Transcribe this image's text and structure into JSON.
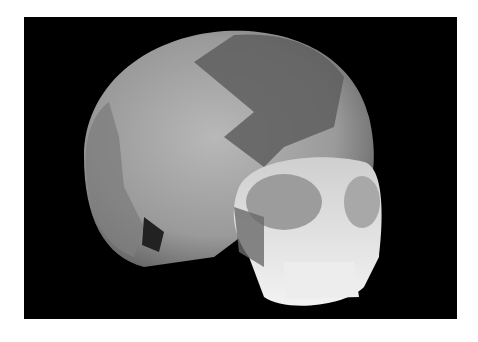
{
  "image": {
    "subject": "reconstructed human skull, lateral three-quarter view",
    "background_color": "#000000",
    "border_color": "#ffffff",
    "alt": "Reconstructed skull with darker original bone fragments on lighter plaster fill"
  }
}
